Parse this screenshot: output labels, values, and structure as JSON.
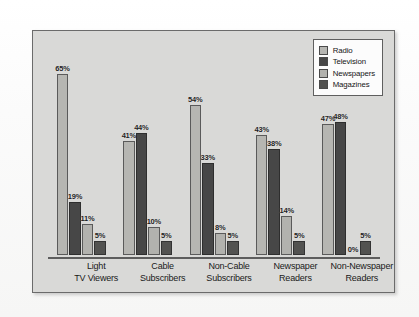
{
  "chart_data": {
    "type": "bar",
    "title": "",
    "subtitle": "",
    "xlabel": "",
    "ylabel": "",
    "ylim": [
      0,
      70
    ],
    "grid": false,
    "legend_position": "top-right",
    "value_suffix": "%",
    "categories": [
      "Light\nTV Viewers",
      "Cable\nSubscribers",
      "Non-Cable\nSubscribers",
      "Newspaper\nReaders",
      "Non-Newspaper\nReaders"
    ],
    "category_lines": [
      [
        "Light",
        "TV Viewers"
      ],
      [
        "Cable",
        "Subscribers"
      ],
      [
        "Non-Cable",
        "Subscribers"
      ],
      [
        "Newspaper",
        "Readers"
      ],
      [
        "Non-Newspaper",
        "Readers"
      ]
    ],
    "series": [
      {
        "name": "Radio",
        "color": "#b6b6b2",
        "values": [
          65,
          41,
          54,
          43,
          47
        ],
        "labels": [
          "65%",
          "41%",
          "54%",
          "43%",
          "47%"
        ]
      },
      {
        "name": "Television",
        "color": "#474747",
        "values": [
          19,
          44,
          33,
          38,
          48
        ],
        "labels": [
          "19%",
          "44%",
          "33%",
          "38%",
          "48%"
        ]
      },
      {
        "name": "Newspapers",
        "color": "#b2b2ae",
        "values": [
          11,
          10,
          8,
          14,
          0
        ],
        "labels": [
          "11%",
          "10%",
          "8%",
          "14%",
          "0%"
        ]
      },
      {
        "name": "Magazines",
        "color": "#525250",
        "values": [
          5,
          5,
          5,
          5,
          5
        ],
        "labels": [
          "5%",
          "5%",
          "5%",
          "5%",
          "5%"
        ]
      }
    ]
  },
  "legend": {
    "items": [
      {
        "label": "Radio",
        "color": "#b6b6b2"
      },
      {
        "label": "Television",
        "color": "#474747"
      },
      {
        "label": "Newspapers",
        "color": "#b2b2ae"
      },
      {
        "label": "Magazines",
        "color": "#525250"
      }
    ]
  }
}
